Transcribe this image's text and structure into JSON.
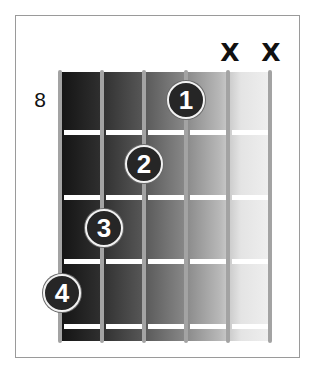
{
  "diagram": {
    "type": "guitar-chord-diagram",
    "start_fret_label": "8",
    "strings": 6,
    "frets_shown": 4,
    "muted_strings": [
      {
        "string": 5,
        "label": "X"
      },
      {
        "string": 6,
        "label": "X"
      }
    ],
    "fingers": [
      {
        "finger": "1",
        "string": 4,
        "fret": 1
      },
      {
        "finger": "2",
        "string": 3,
        "fret": 2
      },
      {
        "finger": "3",
        "string": 2,
        "fret": 3
      },
      {
        "finger": "4",
        "string": 1,
        "fret": 4
      }
    ],
    "colors": {
      "string": "#a3a3a3",
      "fret": "#ffffff",
      "finger_fill": "#262626",
      "finger_text": "#ffffff",
      "shade_dark": "#151515",
      "shade_light": "#efefef",
      "border": "#9a9a9a"
    }
  }
}
